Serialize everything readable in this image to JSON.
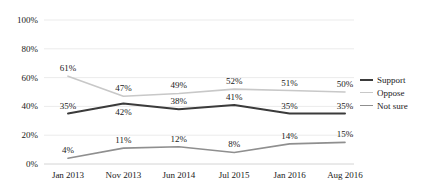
{
  "chart_data": {
    "type": "line",
    "title": "",
    "subtitle": "",
    "xlabel": "",
    "ylabel": "",
    "categories": [
      "Jan 2013",
      "Nov 2013",
      "Jun 2014",
      "Jul 2015",
      "Jan 2016",
      "Aug 2016"
    ],
    "ylim": [
      0,
      100
    ],
    "yticks": [
      "0%",
      "20%",
      "40%",
      "60%",
      "80%",
      "100%"
    ],
    "ytick_values": [
      0,
      20,
      40,
      60,
      80,
      100
    ],
    "grid": true,
    "legend_position": "right",
    "series": [
      {
        "name": "Support",
        "color": "#3b3b3b",
        "width": 2,
        "values": [
          35,
          42,
          38,
          41,
          35,
          35
        ],
        "labels": [
          "35%",
          "42%",
          "38%",
          "41%",
          "35%",
          "35%"
        ],
        "label_side": [
          "above",
          "below",
          "above",
          "above",
          "above",
          "above"
        ]
      },
      {
        "name": "Oppose",
        "color": "#c8c8c8",
        "width": 1.6,
        "values": [
          61,
          47,
          49,
          52,
          51,
          50
        ],
        "labels": [
          "61%",
          "47%",
          "49%",
          "52%",
          "51%",
          "50%"
        ],
        "label_side": [
          "above",
          "above",
          "above",
          "above",
          "above",
          "above"
        ]
      },
      {
        "name": "Not sure",
        "color": "#8f8f8f",
        "width": 1.6,
        "values": [
          4,
          11,
          12,
          8,
          14,
          15
        ],
        "labels": [
          "4%",
          "11%",
          "12%",
          "8%",
          "14%",
          "15%"
        ],
        "label_side": [
          "above",
          "above",
          "above",
          "above",
          "above",
          "above"
        ]
      }
    ]
  },
  "legend": {
    "items": [
      {
        "label": "Support",
        "color": "#3b3b3b"
      },
      {
        "label": "Oppose",
        "color": "#c8c8c8"
      },
      {
        "label": "Not sure",
        "color": "#8f8f8f"
      }
    ]
  },
  "colors": {
    "support": "#3b3b3b",
    "oppose": "#c8c8c8",
    "not_sure": "#8f8f8f",
    "grid": "#e2e2e2",
    "text": "#1a1a1a",
    "background": "#ffffff"
  }
}
